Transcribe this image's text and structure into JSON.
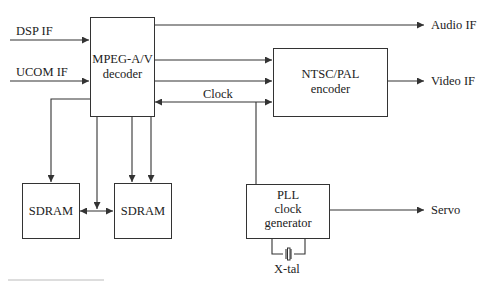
{
  "diagram": {
    "type": "block-diagram",
    "blocks": {
      "decoder": {
        "line1": "MPEG-A/V",
        "line2": "decoder"
      },
      "encoder": {
        "line1": "NTSC/PAL",
        "line2": "encoder"
      },
      "pll": {
        "line1": "PLL",
        "line2": "clock",
        "line3": "generator"
      },
      "sdram1": {
        "label": "SDRAM"
      },
      "sdram2": {
        "label": "SDRAM"
      }
    },
    "inputs": {
      "dsp_if": "DSP IF",
      "ucom_if": "UCOM IF"
    },
    "outputs": {
      "audio_if": "Audio IF",
      "video_if": "Video IF",
      "servo": "Servo"
    },
    "signals": {
      "clock": "Clock",
      "crystal": "X-tal"
    },
    "colors": {
      "line": "#333333",
      "text": "#222222",
      "background": "#ffffff"
    }
  }
}
